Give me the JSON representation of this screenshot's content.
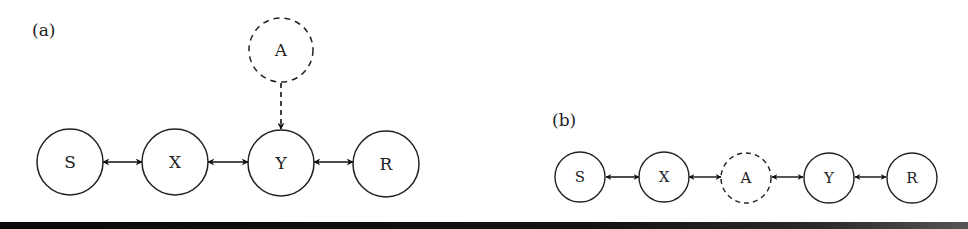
{
  "panels": {
    "a": {
      "label": "(a)",
      "nodes": [
        {
          "id": "S",
          "label": "S",
          "style": "solid"
        },
        {
          "id": "X",
          "label": "X",
          "style": "solid"
        },
        {
          "id": "Y",
          "label": "Y",
          "style": "solid"
        },
        {
          "id": "R",
          "label": "R",
          "style": "solid"
        },
        {
          "id": "A",
          "label": "A",
          "style": "dashed"
        }
      ],
      "edges": [
        {
          "from": "S",
          "to": "X",
          "type": "bidirected"
        },
        {
          "from": "X",
          "to": "Y",
          "type": "bidirected"
        },
        {
          "from": "Y",
          "to": "R",
          "type": "bidirected"
        },
        {
          "from": "A",
          "to": "Y",
          "type": "directed-dashed"
        }
      ]
    },
    "b": {
      "label": "(b)",
      "nodes": [
        {
          "id": "S",
          "label": "S",
          "style": "solid"
        },
        {
          "id": "X",
          "label": "X",
          "style": "solid"
        },
        {
          "id": "A",
          "label": "A",
          "style": "dashed"
        },
        {
          "id": "Y",
          "label": "Y",
          "style": "solid"
        },
        {
          "id": "R",
          "label": "R",
          "style": "solid"
        }
      ],
      "edges": [
        {
          "from": "S",
          "to": "X",
          "type": "bidirected"
        },
        {
          "from": "X",
          "to": "A",
          "type": "bidirected"
        },
        {
          "from": "A",
          "to": "Y",
          "type": "bidirected"
        },
        {
          "from": "Y",
          "to": "R",
          "type": "bidirected"
        }
      ]
    }
  },
  "colors": {
    "stroke": "#222222",
    "background": "#ffffff",
    "bar": "#0a0a0a"
  }
}
